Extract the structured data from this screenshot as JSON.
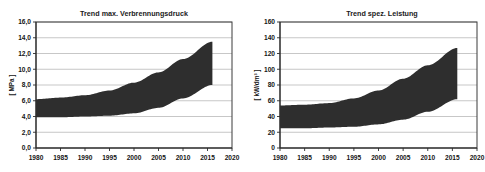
{
  "figure": {
    "background_color": "#ffffff",
    "width": 485,
    "height": 172
  },
  "charts": [
    {
      "id": "verbrennungsdruck",
      "title": "Trend max. Verbrennungsdruck",
      "ylabel": "[ MPa ]",
      "xlabel": "",
      "ytick_labels": [
        "0,0",
        "2,0",
        "4,0",
        "6,0",
        "8,0",
        "10,0",
        "12,0",
        "14,0",
        "16,0"
      ],
      "xtick_labels": [
        "1980",
        "1985",
        "1990",
        "1995",
        "2000",
        "2005",
        "2010",
        "2015",
        "2020"
      ],
      "band_color": "#2e2e2e",
      "grid_color": "#b9b9b9"
    },
    {
      "id": "spez-leistung",
      "title": "Trend spez. Leistung",
      "ylabel": "[ kW/dm³ ]",
      "xlabel": "",
      "ytick_labels": [
        "0",
        "20",
        "40",
        "60",
        "80",
        "100",
        "120",
        "140",
        "160"
      ],
      "xtick_labels": [
        "1980",
        "1985",
        "1990",
        "1995",
        "2000",
        "2005",
        "2010",
        "2015",
        "2020"
      ],
      "band_color": "#2e2e2e",
      "grid_color": "#b9b9b9"
    }
  ],
  "chart_data": [
    {
      "type": "area",
      "id": "verbrennungsdruck",
      "title": "Trend max. Verbrennungsdruck",
      "xlabel": "",
      "ylabel": "[ MPa ]",
      "xlim": [
        1980,
        2020
      ],
      "ylim": [
        0.0,
        16.0
      ],
      "yticks": [
        0.0,
        2.0,
        4.0,
        6.0,
        8.0,
        10.0,
        12.0,
        14.0,
        16.0
      ],
      "xticks": [
        1980,
        1985,
        1990,
        1995,
        2000,
        2005,
        2010,
        2015,
        2020
      ],
      "grid": true,
      "legend": "none",
      "x": [
        1980,
        1985,
        1990,
        1995,
        2000,
        2005,
        2010,
        2016
      ],
      "series": [
        {
          "name": "upper bound",
          "values": [
            6.2,
            6.4,
            6.7,
            7.3,
            8.3,
            9.6,
            11.3,
            13.5
          ]
        },
        {
          "name": "lower bound",
          "values": [
            3.9,
            3.9,
            4.0,
            4.1,
            4.4,
            5.1,
            6.3,
            8.0
          ]
        }
      ]
    },
    {
      "type": "area",
      "id": "spez-leistung",
      "title": "Trend spez. Leistung",
      "xlabel": "",
      "ylabel": "[ kW/dm³ ]",
      "xlim": [
        1980,
        2020
      ],
      "ylim": [
        0,
        160
      ],
      "yticks": [
        0,
        20,
        40,
        60,
        80,
        100,
        120,
        140,
        160
      ],
      "xticks": [
        1980,
        1985,
        1990,
        1995,
        2000,
        2005,
        2010,
        2015,
        2020
      ],
      "grid": true,
      "legend": "none",
      "x": [
        1980,
        1985,
        1990,
        1995,
        2000,
        2005,
        2010,
        2016
      ],
      "series": [
        {
          "name": "upper bound",
          "values": [
            54,
            55,
            57,
            63,
            73,
            88,
            105,
            127
          ]
        },
        {
          "name": "lower bound",
          "values": [
            25,
            25,
            26,
            27,
            30,
            36,
            46,
            62
          ]
        }
      ]
    }
  ]
}
